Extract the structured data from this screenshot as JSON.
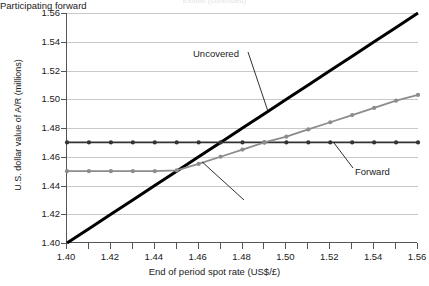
{
  "title_remnant": "Exhibit (continued)",
  "chart_data": {
    "type": "line",
    "title": "",
    "xlabel": "End of period spot rate (US$/£)",
    "ylabel": "U.S. dollar value of A/R (millions)",
    "xlim": [
      1.4,
      1.56
    ],
    "ylim": [
      1.4,
      1.56
    ],
    "xticks": [
      "1.40",
      "1.42",
      "1.44",
      "1.46",
      "1.48",
      "1.50",
      "1.52",
      "1.54",
      "1.56"
    ],
    "xtick_values": [
      1.4,
      1.42,
      1.44,
      1.46,
      1.48,
      1.5,
      1.52,
      1.54,
      1.56
    ],
    "xminor_step": 0.01,
    "yticks": [
      "1.40",
      "1.42",
      "1.44",
      "1.46",
      "1.48",
      "1.50",
      "1.52",
      "1.54",
      "1.56"
    ],
    "ytick_values": [
      1.4,
      1.42,
      1.44,
      1.46,
      1.48,
      1.5,
      1.52,
      1.54,
      1.56
    ],
    "grid": "horizontal",
    "grid_color": "#c9c9c9",
    "legend": "none (inline annotations with leader lines)",
    "x": [
      1.4,
      1.41,
      1.42,
      1.43,
      1.44,
      1.45,
      1.46,
      1.47,
      1.48,
      1.49,
      1.5,
      1.51,
      1.52,
      1.53,
      1.54,
      1.55,
      1.56
    ],
    "series": [
      {
        "name": "Uncovered",
        "color": "#000000",
        "markers": false,
        "width": 3,
        "values": [
          1.4,
          1.41,
          1.42,
          1.43,
          1.44,
          1.45,
          1.46,
          1.47,
          1.48,
          1.49,
          1.5,
          1.51,
          1.52,
          1.53,
          1.54,
          1.55,
          1.56
        ]
      },
      {
        "name": "Forward",
        "color": "#333333",
        "markers": true,
        "width": 1.6,
        "values": [
          1.47,
          1.47,
          1.47,
          1.47,
          1.47,
          1.47,
          1.47,
          1.47,
          1.47,
          1.47,
          1.47,
          1.47,
          1.47,
          1.47,
          1.47,
          1.47,
          1.47
        ]
      },
      {
        "name": "Participating forward",
        "color": "#8c8c8c",
        "markers": true,
        "width": 1.8,
        "values": [
          1.45,
          1.45,
          1.45,
          1.45,
          1.45,
          1.4505,
          1.455,
          1.46,
          1.465,
          1.47,
          1.474,
          1.479,
          1.484,
          1.489,
          1.494,
          1.499,
          1.503
        ]
      }
    ],
    "annotations": [
      {
        "label": "Uncovered",
        "target_x": 1.492,
        "target_y": 1.492
      },
      {
        "label": "Forward",
        "target_x": 1.522,
        "target_y": 1.47
      },
      {
        "label": "Participating forward",
        "target_x": 1.462,
        "target_y": 1.4565
      }
    ]
  }
}
